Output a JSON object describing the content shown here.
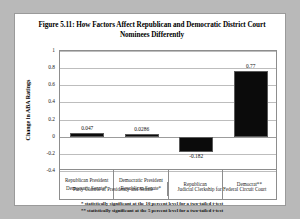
{
  "figure": {
    "title": "Figure 5.11: How Factors Affect Republican and Democratic District Court Nominees Differently",
    "notes": [
      "* statistically significant at the 10 percent level for a two-tailed t-test",
      "** statistically significant at the 5 percent level for a two-tailed t-test"
    ]
  },
  "chart_data": {
    "type": "bar",
    "title": "Figure 5.11: How Factors Affect Republican and Democratic District Court Nominees Differently",
    "xlabel": "",
    "ylabel": "Change in ABA Ratings",
    "ylim": [
      -0.4,
      1
    ],
    "yticks": [
      "1",
      "0.8",
      "0.6",
      "0.4",
      "0.2",
      "0",
      "-0.2",
      "-0.4"
    ],
    "ytick_values": [
      1,
      0.8,
      0.6,
      0.4,
      0.2,
      0,
      -0.2,
      -0.4
    ],
    "grid": true,
    "legend": "none",
    "categories": [
      "Republican President Democratic Senate*",
      "Democratic President Republican Senate*",
      "Republican",
      "Democrat**"
    ],
    "values": [
      0.047,
      0.0286,
      -0.182,
      0.77
    ],
    "data_labels": [
      "0.047",
      "0.0286",
      "-0.182",
      "0.77"
    ],
    "groups": [
      {
        "label": "Party Control of Presidency and Senate",
        "span": 2
      },
      {
        "label": "Judicial Clerkship for Federal Circuit Court",
        "span": 2
      }
    ],
    "bar_color": "#0b0b0b"
  }
}
